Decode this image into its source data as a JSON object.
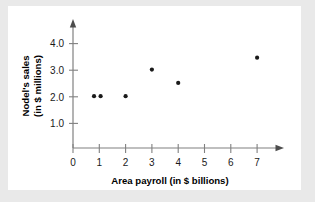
{
  "chart_data": {
    "type": "scatter",
    "title": "",
    "xlabel": "Area payroll (in $ billions)",
    "ylabel": "Nodel's sales (in $ millions)",
    "ylabel_line1": "Nodel's sales",
    "ylabel_line2": "(in $ millions)",
    "xlim": [
      0,
      7.6
    ],
    "ylim": [
      0,
      4.45
    ],
    "xticks": [
      0,
      1,
      2,
      3,
      4,
      5,
      6,
      7
    ],
    "xtick_labels": [
      "0",
      "1",
      "2",
      "3",
      "4",
      "5",
      "6",
      "7"
    ],
    "yticks": [
      1.0,
      2.0,
      3.0,
      4.0
    ],
    "ytick_labels": [
      "1.0",
      "2.0",
      "3.0",
      "4.0"
    ],
    "grid": false,
    "legend": false,
    "x": [
      0.8,
      1.05,
      2.0,
      3.0,
      4.0,
      7.0
    ],
    "y": [
      2.0,
      2.0,
      2.0,
      3.0,
      2.5,
      3.45
    ],
    "points": [
      {
        "x": 0.8,
        "y": 2.0
      },
      {
        "x": 1.05,
        "y": 2.0
      },
      {
        "x": 2.0,
        "y": 2.0
      },
      {
        "x": 3.0,
        "y": 3.0
      },
      {
        "x": 4.0,
        "y": 2.5
      },
      {
        "x": 7.0,
        "y": 3.45
      }
    ],
    "marker": "circle",
    "marker_color": "#1a1a1a",
    "axis_color": "#808080",
    "panel_color": "#ffffff",
    "figure_color": "#e9e9e9"
  }
}
